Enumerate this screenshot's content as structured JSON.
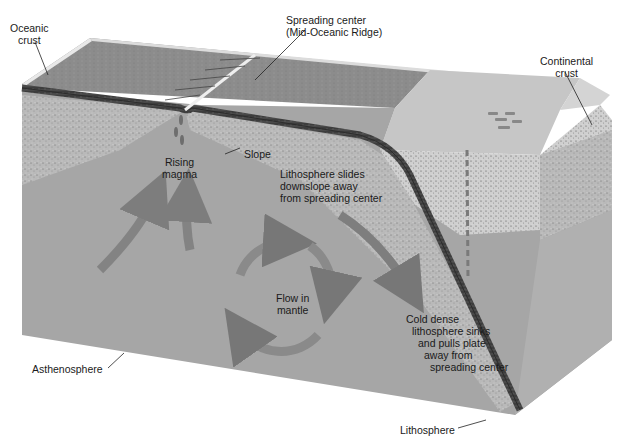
{
  "diagram": {
    "colors": {
      "ocean_surface": "#8a8a8a",
      "lithosphere_band": "#3a3a3a",
      "crust_speckle": "#b8b8b8",
      "asthenosphere": "#a4a4a4",
      "continental_top": "#c9c9c9",
      "continental_side": "#bdbdbd",
      "arrow": "#7e7e7e",
      "background": "#ffffff"
    }
  },
  "labels": {
    "oceanic_crust": [
      "Oceanic",
      "crust"
    ],
    "spreading_center": [
      "Spreading center",
      "(Mid-Oceanic Ridge)"
    ],
    "continental_crust": [
      "Continental",
      "crust"
    ],
    "rising_magma": [
      "Rising",
      "magma"
    ],
    "slope": "Slope",
    "lithosphere_slides": [
      "Lithosphere slides",
      "downslope away",
      "from spreading center"
    ],
    "flow_in_mantle": [
      "Flow in",
      "mantle"
    ],
    "cold_dense": [
      "Cold dense",
      "lithosphere sinks",
      "and pulls plate",
      "away from",
      "spreading center"
    ],
    "asthenosphere": "Asthenosphere",
    "lithosphere": "Lithosphere"
  }
}
